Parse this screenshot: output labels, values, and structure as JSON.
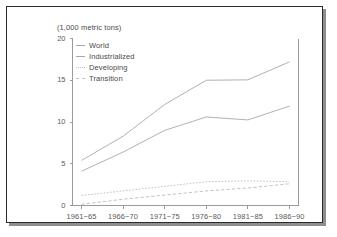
{
  "chart_data": {
    "type": "line",
    "title": "(1,000 metric tons)",
    "xlabel": "",
    "ylabel": "",
    "categories": [
      "1961−65",
      "1966−70",
      "1971−75",
      "1976−80",
      "1981−85",
      "1986−90"
    ],
    "yticks": [
      0,
      5,
      10,
      15,
      20
    ],
    "ylim": [
      0,
      20
    ],
    "grid": false,
    "legend_position": "top-left",
    "series": [
      {
        "name": "World",
        "style": "solid",
        "color": "#a8a8a8",
        "values": [
          5.4,
          8.3,
          12.1,
          15.0,
          15.05,
          17.2
        ]
      },
      {
        "name": "Industrialized",
        "style": "solid",
        "color": "#a8a8a8",
        "values": [
          4.1,
          6.4,
          9.0,
          10.6,
          10.25,
          11.9
        ]
      },
      {
        "name": "Developing",
        "style": "dotted",
        "color": "#c2c2c2",
        "values": [
          1.2,
          1.75,
          2.3,
          2.85,
          2.95,
          2.85
        ]
      },
      {
        "name": "Transition",
        "style": "dashed",
        "color": "#c2c2c2",
        "values": [
          0.15,
          0.75,
          1.25,
          1.75,
          2.1,
          2.6
        ]
      }
    ]
  },
  "legend": {
    "items": [
      {
        "label": "World"
      },
      {
        "label": "Industrialized"
      },
      {
        "label": "Developing"
      },
      {
        "label": "Transition"
      }
    ]
  }
}
